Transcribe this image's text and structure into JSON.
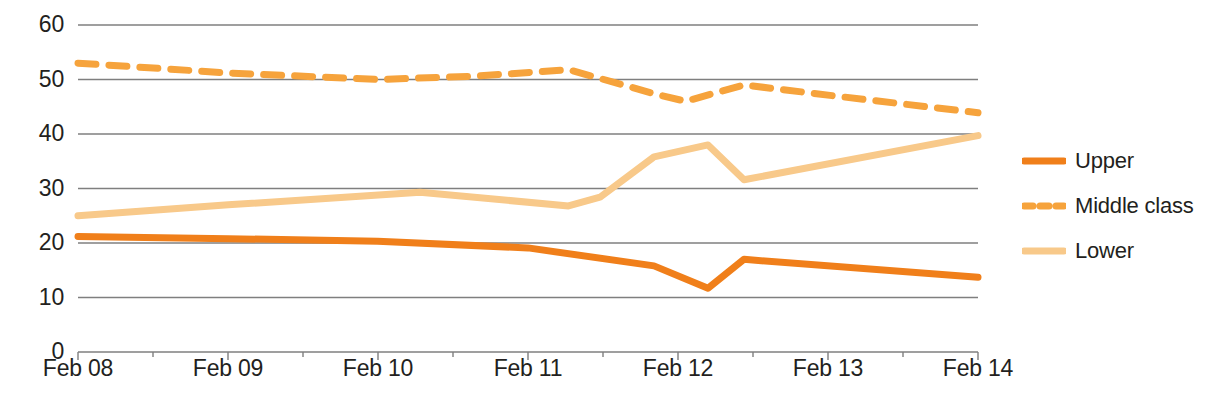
{
  "chart_data": {
    "type": "line",
    "title": "",
    "xlabel": "",
    "ylabel": "",
    "x": [
      "Feb 08",
      "Feb 09",
      "Feb 10",
      "Feb 11",
      "Feb 12",
      "Feb 13",
      "Feb 14"
    ],
    "xtick_labels": [
      "Feb 08",
      "Feb 09",
      "Feb 10",
      "Feb 11",
      "Feb 12",
      "Feb 13",
      "Feb 14"
    ],
    "ytick_labels": [
      "60",
      "50",
      "40",
      "30",
      "20",
      "10",
      "0"
    ],
    "ytick_values": [
      60,
      50,
      40,
      30,
      20,
      10,
      0
    ],
    "ylim": [
      0,
      60
    ],
    "grid": true,
    "grid_axis": "y",
    "legend_position": "right",
    "series": [
      {
        "name": "Upper",
        "style": "solid",
        "color": "#F07F1A",
        "width": 7,
        "values": [
          21.2,
          20.8,
          20.3,
          19.1,
          15.8,
          17.0,
          13.7
        ],
        "points": [
          {
            "xf": 0.0,
            "v": 21.2
          },
          {
            "xf": 0.167,
            "v": 20.8
          },
          {
            "xf": 0.333,
            "v": 20.3
          },
          {
            "xf": 0.5,
            "v": 19.1
          },
          {
            "xf": 0.64,
            "v": 15.8
          },
          {
            "xf": 0.7,
            "v": 11.7
          },
          {
            "xf": 0.74,
            "v": 17.0
          },
          {
            "xf": 1.0,
            "v": 13.7
          }
        ]
      },
      {
        "name": "Middle class",
        "style": "dashed",
        "color": "#F6A33C",
        "width": 7,
        "values": [
          53.0,
          51.2,
          50.0,
          51.8,
          46.0,
          49.0,
          43.9
        ],
        "points": [
          {
            "xf": 0.0,
            "v": 53.0
          },
          {
            "xf": 0.167,
            "v": 51.2
          },
          {
            "xf": 0.333,
            "v": 50.0
          },
          {
            "xf": 0.44,
            "v": 50.6
          },
          {
            "xf": 0.545,
            "v": 51.8
          },
          {
            "xf": 0.58,
            "v": 50.2
          },
          {
            "xf": 0.64,
            "v": 47.4
          },
          {
            "xf": 0.675,
            "v": 46.0
          },
          {
            "xf": 0.74,
            "v": 49.0
          },
          {
            "xf": 0.84,
            "v": 47.0
          },
          {
            "xf": 1.0,
            "v": 43.9
          }
        ]
      },
      {
        "name": "Lower",
        "style": "solid",
        "color": "#F8C98A",
        "width": 7,
        "values": [
          25.0,
          27.0,
          29.3,
          26.8,
          35.8,
          31.6,
          39.7
        ],
        "points": [
          {
            "xf": 0.0,
            "v": 25.0
          },
          {
            "xf": 0.167,
            "v": 27.0
          },
          {
            "xf": 0.38,
            "v": 29.3
          },
          {
            "xf": 0.545,
            "v": 26.8
          },
          {
            "xf": 0.58,
            "v": 28.4
          },
          {
            "xf": 0.64,
            "v": 35.8
          },
          {
            "xf": 0.7,
            "v": 38.0
          },
          {
            "xf": 0.74,
            "v": 31.6
          },
          {
            "xf": 1.0,
            "v": 39.7
          }
        ]
      }
    ]
  },
  "legend": {
    "items": [
      {
        "label": "Upper",
        "color": "#F07F1A",
        "style": "solid"
      },
      {
        "label": "Middle class",
        "color": "#F6A33C",
        "style": "dashed"
      },
      {
        "label": "Lower",
        "color": "#F8C98A",
        "style": "solid"
      }
    ]
  },
  "colors": {
    "upper": "#F07F1A",
    "middle_class": "#F6A33C",
    "lower": "#F8C98A",
    "grid": "#7f7f7f",
    "text": "#231f20",
    "background": "#ffffff"
  }
}
